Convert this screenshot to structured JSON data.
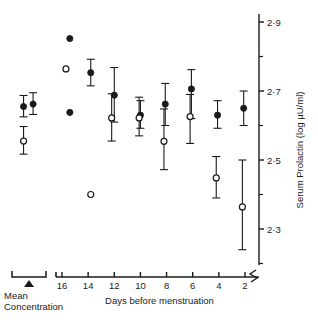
{
  "chart_data": {
    "type": "scatter",
    "title": "",
    "xlabel": "Days before menstruation",
    "ylabel": "Serum Prolactin (log µU/ml)",
    "ylim": [
      2.18,
      2.93
    ],
    "y_ticks_major": [
      "2·9",
      "2·7",
      "2·5",
      "2·3"
    ],
    "y_tick_values": [
      2.9,
      2.7,
      2.5,
      2.3
    ],
    "y_minor_tick_values": [
      2.8,
      2.6,
      2.4,
      2.2
    ],
    "x_ticks": [
      "16",
      "14",
      "12",
      "10",
      "8",
      "6",
      "4",
      "2"
    ],
    "x_tick_values": [
      16,
      14,
      12,
      10,
      8,
      6,
      4,
      2
    ],
    "x_axis_direction": "decreasing",
    "grid": false,
    "legend": "none",
    "axis_break_x_right": true,
    "inset_panel": {
      "label_line1": "Mean",
      "label_line2": "Concentration",
      "marker": "filled-triangle",
      "bracket": true,
      "points": [
        {
          "series": "filled",
          "x": 0.34,
          "y": 2.655,
          "err_low": 2.625,
          "err_high": 2.687
        },
        {
          "series": "filled",
          "x": 0.62,
          "y": 2.662,
          "err_low": 2.632,
          "err_high": 2.695
        },
        {
          "series": "open",
          "x": 0.34,
          "y": 2.555,
          "err_low": 2.517,
          "err_high": 2.597
        }
      ]
    },
    "series": [
      {
        "name": "filled",
        "marker": "filled-circle",
        "points": [
          {
            "x": 15.4,
            "y": 2.852,
            "err_low": null,
            "err_high": null
          },
          {
            "x": 15.4,
            "y": 2.638,
            "err_low": null,
            "err_high": null
          },
          {
            "x": 13.8,
            "y": 2.753,
            "err_low": 2.715,
            "err_high": 2.792
          },
          {
            "x": 12.0,
            "y": 2.688,
            "err_low": 2.61,
            "err_high": 2.768
          },
          {
            "x": 10.0,
            "y": 2.63,
            "err_low": 2.592,
            "err_high": 2.672
          },
          {
            "x": 8.1,
            "y": 2.662,
            "err_low": 2.6,
            "err_high": 2.722
          },
          {
            "x": 6.1,
            "y": 2.706,
            "err_low": 2.62,
            "err_high": 2.762
          },
          {
            "x": 4.1,
            "y": 2.63,
            "err_low": 2.592,
            "err_high": 2.672
          },
          {
            "x": 2.1,
            "y": 2.65,
            "err_low": 2.6,
            "err_high": 2.7
          }
        ]
      },
      {
        "name": "open",
        "marker": "open-circle",
        "points": [
          {
            "x": 15.7,
            "y": 2.764,
            "err_low": null,
            "err_high": null
          },
          {
            "x": 13.8,
            "y": 2.4,
            "err_low": null,
            "err_high": null
          },
          {
            "x": 12.2,
            "y": 2.622,
            "err_low": 2.555,
            "err_high": 2.692
          },
          {
            "x": 10.1,
            "y": 2.622,
            "err_low": 2.57,
            "err_high": 2.682
          },
          {
            "x": 8.2,
            "y": 2.554,
            "err_low": 2.472,
            "err_high": 2.648
          },
          {
            "x": 6.2,
            "y": 2.626,
            "err_low": 2.548,
            "err_high": 2.69
          },
          {
            "x": 4.2,
            "y": 2.448,
            "err_low": 2.39,
            "err_high": 2.51
          },
          {
            "x": 2.2,
            "y": 2.364,
            "err_low": 2.24,
            "err_high": 2.5
          }
        ]
      }
    ]
  },
  "axes": {
    "y_title": "Serum Prolactin (log µU/ml)",
    "x_title": "Days before menstruation"
  },
  "inset": {
    "line1": "Mean",
    "line2": "Concentration"
  },
  "colors": {
    "ink": "#1a1a1a",
    "marker_fill": "#1a1a1a",
    "marker_open": "#ffffff"
  }
}
